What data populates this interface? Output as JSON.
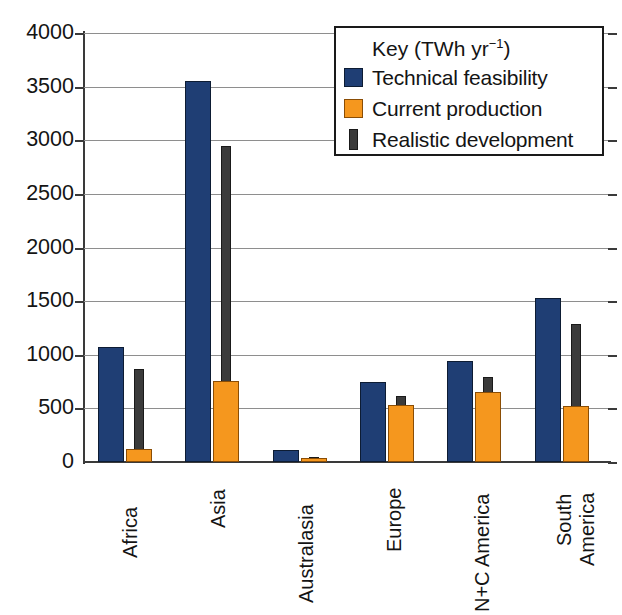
{
  "chart_data": {
    "type": "bar",
    "title": "",
    "xlabel": "",
    "ylabel": "",
    "ylim": [
      0,
      4000
    ],
    "ytick_step": 500,
    "yticks": [
      "4000",
      "3500",
      "3000",
      "2500",
      "2000",
      "1500",
      "1000",
      "500",
      "0"
    ],
    "grid": true,
    "categories": [
      "Africa",
      "Asia",
      "Australasia",
      "Europe",
      "N+C America",
      "South America"
    ],
    "series": [
      {
        "name": "Technical feasibility",
        "color": "#1f3e74",
        "values": [
          1070,
          3550,
          110,
          750,
          940,
          1530
        ]
      },
      {
        "name": "Current production",
        "color": "#f5971e",
        "values": [
          120,
          760,
          40,
          530,
          650,
          520
        ]
      },
      {
        "name": "Realistic development",
        "color": "#3b3b3b",
        "values": [
          870,
          2950,
          45,
          620,
          790,
          1290
        ]
      }
    ],
    "legend": {
      "position": "top-right",
      "title": "Key (TWh yr",
      "title_sup": "-1",
      "title_close": ")",
      "entries": [
        {
          "label": "Technical feasibility",
          "swatch": "tech"
        },
        {
          "label": "Current production",
          "swatch": "current"
        },
        {
          "label": "Realistic development",
          "swatch": "real"
        }
      ]
    }
  },
  "axis": {
    "y": {
      "t0": "4000",
      "t1": "3500",
      "t2": "3000",
      "t3": "2500",
      "t4": "2000",
      "t5": "1500",
      "t6": "1000",
      "t7": "500",
      "t8": "0"
    }
  },
  "categories": {
    "c0_l0": "Africa",
    "c1_l0": "Asia",
    "c2_l0": "Australasia",
    "c3_l0": "Europe",
    "c4_l0": "N+C America",
    "c5_l0": "South",
    "c5_l1": "America"
  },
  "legend": {
    "title_main": "Key (TWh yr",
    "title_sup": "−1",
    "title_end": ")",
    "e0": "Technical feasibility",
    "e1": "Current production",
    "e2": "Realistic development"
  }
}
